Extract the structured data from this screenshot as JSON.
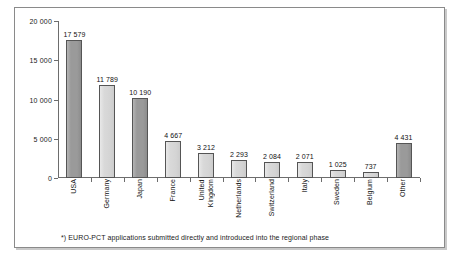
{
  "chart_data": {
    "type": "bar",
    "title": "",
    "subtitle": "",
    "xlabel": "",
    "ylabel": "",
    "ylim": [
      0,
      20000
    ],
    "grid": false,
    "legend": "none",
    "ytick_labels": [
      "0",
      "5 000",
      "10 000",
      "15 000",
      "20 000"
    ],
    "ytick_values": [
      0,
      5000,
      10000,
      15000,
      20000
    ],
    "categories": [
      "USA",
      "Germany",
      "Japan",
      "France",
      "United\nKingdom",
      "Netherlands",
      "Switzerland",
      "Italy",
      "Sweden",
      "Belgium",
      "Other"
    ],
    "values": [
      17579,
      11789,
      10190,
      4667,
      3212,
      2293,
      2084,
      2071,
      1025,
      737,
      4431
    ],
    "value_labels": [
      "17 579",
      "11 789",
      "10 190",
      "4 667",
      "3 212",
      "2 293",
      "2 084",
      "2 071",
      "1 025",
      "737",
      "4 431"
    ],
    "bar_shades": [
      "dark",
      "light",
      "dark",
      "light",
      "light",
      "light",
      "light",
      "light",
      "light",
      "light",
      "dark"
    ],
    "colors": {
      "bar_dark": "#9a9a9a",
      "bar_light": "#d6d6d6",
      "bar_border": "#555555",
      "axis": "#6d6d6d",
      "text": "#111111",
      "frame": "#8a8a8a"
    }
  },
  "footnote": "*) EURO-PCT applications submitted directly and introduced into the regional phase"
}
